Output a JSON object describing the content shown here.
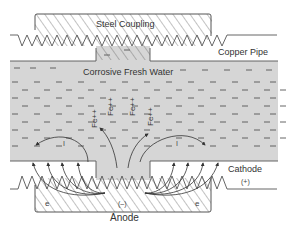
{
  "labels": {
    "steel_coupling": "Steel Coupling",
    "copper_pipe": "Copper Pipe",
    "water": "Corrosive Fresh Water",
    "cathode": "Cathode",
    "cathode_sign": "(+)",
    "anode": "Anode",
    "anode_sign": "(–)",
    "electron_left": "e",
    "electron_right": "e",
    "current_left": "I",
    "current_right": "I",
    "ions": [
      "Fe++",
      "Fe++",
      "Fe++",
      "Fe++"
    ]
  },
  "colors": {
    "water_fill": "#d6d6d6",
    "line": "#555555",
    "text": "#333333",
    "background": "#ffffff"
  }
}
